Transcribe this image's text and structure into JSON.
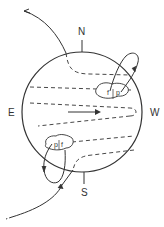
{
  "diagram": {
    "compass": {
      "north": "N",
      "south": "S",
      "east": "E",
      "west": "W"
    },
    "sunspots": [
      {
        "hemisphere": "north",
        "labels": [
          "f",
          "p"
        ]
      },
      {
        "hemisphere": "south",
        "labels": [
          "p",
          "f"
        ]
      }
    ],
    "colors": {
      "stroke": "#333333",
      "background": "#ffffff"
    }
  }
}
